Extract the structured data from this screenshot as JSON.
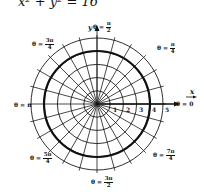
{
  "equation": "x² + y² = 16",
  "axes": {
    "x_label": "x",
    "y_label": "y"
  },
  "radial_ticks": [
    "1",
    "2",
    "3",
    "4",
    "5"
  ],
  "angle_labels": {
    "theta_0": {
      "prefix": "θ = ",
      "value": "0"
    },
    "theta_pi_over_4": {
      "prefix": "θ = ",
      "num": "π",
      "den": "4"
    },
    "theta_pi_over_2": {
      "prefix": "θ = ",
      "num": "π",
      "den": "2"
    },
    "theta_3pi_over_4": {
      "prefix": "θ = ",
      "num": "3π",
      "den": "4"
    },
    "theta_pi": {
      "prefix": "θ = ",
      "value": "π"
    },
    "theta_5pi_over_4": {
      "prefix": "θ = ",
      "num": "5π",
      "den": "4"
    },
    "theta_3pi_over_2": {
      "prefix": "θ = ",
      "num": "3π",
      "den": "2"
    },
    "theta_7pi_over_4": {
      "prefix": "θ = ",
      "num": "7π",
      "den": "4"
    }
  },
  "grid": {
    "circles": [
      1,
      2,
      3,
      4,
      5
    ],
    "highlighted_circle_radius": 4,
    "radial_line_step_degrees": 15,
    "line_color": "#1a1a1a"
  }
}
